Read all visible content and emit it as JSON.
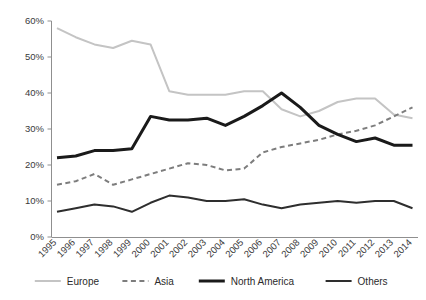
{
  "chart_data": {
    "type": "line",
    "title": "",
    "xlabel": "",
    "ylabel": "",
    "ylim": [
      0,
      60
    ],
    "ytick_labels": [
      "0%",
      "10%",
      "20%",
      "30%",
      "40%",
      "50%",
      "60%"
    ],
    "ytick_values": [
      0,
      10,
      20,
      30,
      40,
      50,
      60
    ],
    "grid": false,
    "legend_position": "bottom",
    "categories": [
      "1995",
      "1996",
      "1997",
      "1998",
      "1999",
      "2000",
      "2001",
      "2002",
      "2003",
      "2004",
      "2005",
      "2006",
      "2007",
      "2008",
      "2009",
      "2010",
      "2011",
      "2012",
      "2013",
      "2014"
    ],
    "series": [
      {
        "name": "Europe",
        "color": "#c4c4c4",
        "style": "solid",
        "width": 2,
        "values": [
          58.0,
          55.5,
          53.5,
          52.5,
          54.5,
          53.5,
          40.5,
          39.5,
          39.5,
          39.5,
          40.5,
          40.5,
          35.5,
          33.5,
          35.0,
          37.5,
          38.5,
          38.5,
          34.0,
          33.0
        ]
      },
      {
        "name": "Asia",
        "color": "#7d7d7d",
        "style": "dashed",
        "width": 2,
        "values": [
          14.5,
          15.5,
          17.5,
          14.5,
          16.0,
          17.5,
          19.0,
          20.5,
          20.0,
          18.5,
          19.0,
          23.5,
          25.0,
          26.0,
          27.0,
          28.5,
          29.5,
          31.0,
          33.5,
          36.0
        ]
      },
      {
        "name": "North America",
        "color": "#1a1a1a",
        "style": "solid",
        "width": 3,
        "values": [
          22.0,
          22.5,
          24.0,
          24.0,
          24.5,
          33.5,
          32.5,
          32.5,
          33.0,
          31.0,
          33.5,
          36.5,
          40.0,
          36.0,
          31.0,
          28.5,
          26.5,
          27.5,
          25.5,
          25.5
        ]
      },
      {
        "name": "Others",
        "color": "#2e2e2e",
        "style": "solid",
        "width": 2,
        "values": [
          7.0,
          8.0,
          9.0,
          8.5,
          7.0,
          9.5,
          11.5,
          11.0,
          10.0,
          10.0,
          10.5,
          9.0,
          8.0,
          9.0,
          9.5,
          10.0,
          9.5,
          10.0,
          10.0,
          8.0
        ]
      }
    ]
  },
  "legend": {
    "items": [
      {
        "label": "Europe"
      },
      {
        "label": "Asia"
      },
      {
        "label": "North America"
      },
      {
        "label": "Others"
      }
    ]
  }
}
